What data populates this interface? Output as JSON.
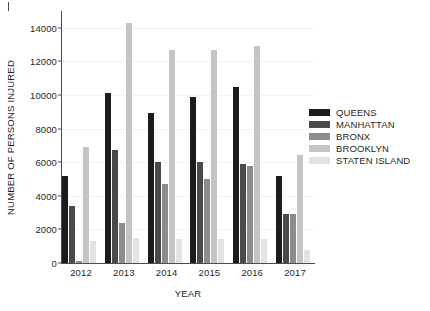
{
  "chart_data": {
    "type": "bar",
    "title": "",
    "xlabel": "YEAR",
    "ylabel": "NUMBER OF PERSONS INJURED",
    "categories": [
      "2012",
      "2013",
      "2014",
      "2015",
      "2016",
      "2017"
    ],
    "ylim": [
      0,
      15000
    ],
    "yticks": [
      0,
      2000,
      4000,
      6000,
      8000,
      10000,
      12000,
      14000
    ],
    "ytick_labels": [
      "0",
      "2000",
      "4000",
      "6000",
      "8000",
      "10000",
      "12000",
      "14000"
    ],
    "grid": true,
    "legend_position": "right",
    "series": [
      {
        "name": "QUEENS",
        "color": "#1c1c1c",
        "values": [
          5200,
          10100,
          8900,
          9900,
          10500,
          5200
        ]
      },
      {
        "name": "MANHATTAN",
        "color": "#4a4a4a",
        "values": [
          3400,
          6700,
          6000,
          6000,
          5900,
          2900
        ]
      },
      {
        "name": "BRONX",
        "color": "#8c8c8c",
        "values": [
          120,
          2400,
          4700,
          5000,
          5800,
          2900
        ]
      },
      {
        "name": "BROOKLYN",
        "color": "#c4c4c4",
        "values": [
          6900,
          14300,
          12700,
          12700,
          12900,
          6400
        ]
      },
      {
        "name": "STATEN ISLAND",
        "color": "#e2e2e2",
        "values": [
          1300,
          1500,
          1400,
          1400,
          1400,
          750
        ]
      }
    ]
  }
}
